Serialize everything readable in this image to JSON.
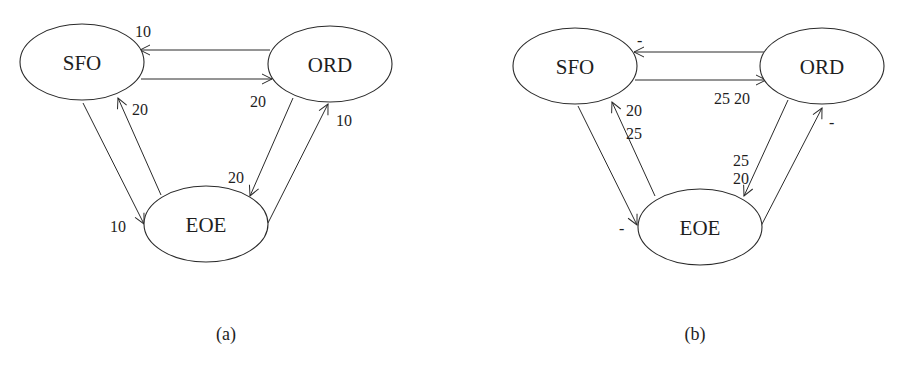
{
  "diagrams": [
    {
      "id": "a",
      "caption": "(a)",
      "nodes": [
        {
          "id": "SFO",
          "label": "SFO",
          "cx": 82,
          "cy": 62,
          "rx": 62,
          "ry": 38
        },
        {
          "id": "ORD",
          "label": "ORD",
          "cx": 330,
          "cy": 64,
          "rx": 62,
          "ry": 38
        },
        {
          "id": "EOE",
          "label": "EOE",
          "cx": 206,
          "cy": 224,
          "rx": 62,
          "ry": 38
        }
      ],
      "edges": [
        {
          "from": "ORD",
          "to": "SFO",
          "x1": 270,
          "y1": 50,
          "x2": 140,
          "y2": 50,
          "label": "10",
          "lx": 135,
          "ly": 37
        },
        {
          "from": "SFO",
          "to": "ORD",
          "x1": 141,
          "y1": 79,
          "x2": 272,
          "y2": 79,
          "label": "20",
          "lx": 250,
          "ly": 107
        },
        {
          "from": "SFO",
          "to": "EOE",
          "x1": 83,
          "y1": 103,
          "x2": 144,
          "y2": 224,
          "label": "10",
          "lx": 110,
          "ly": 232
        },
        {
          "from": "EOE",
          "to": "SFO",
          "x1": 161,
          "y1": 195,
          "x2": 118,
          "y2": 98,
          "label": "20",
          "lx": 132,
          "ly": 115
        },
        {
          "from": "ORD",
          "to": "EOE",
          "x1": 293,
          "y1": 98,
          "x2": 250,
          "y2": 196,
          "label": "20",
          "lx": 228,
          "ly": 183
        },
        {
          "from": "EOE",
          "to": "ORD",
          "x1": 268,
          "y1": 223,
          "x2": 328,
          "y2": 104,
          "label": "10",
          "lx": 336,
          "ly": 126
        }
      ]
    },
    {
      "id": "b",
      "caption": "(b)",
      "nodes": [
        {
          "id": "SFO",
          "label": "SFO",
          "cx": 575,
          "cy": 66,
          "rx": 62,
          "ry": 38
        },
        {
          "id": "ORD",
          "label": "ORD",
          "cx": 822,
          "cy": 66,
          "rx": 62,
          "ry": 38
        },
        {
          "id": "EOE",
          "label": "EOE",
          "cx": 700,
          "cy": 227,
          "rx": 62,
          "ry": 38
        }
      ],
      "edges": [
        {
          "from": "ORD",
          "to": "SFO",
          "x1": 764,
          "y1": 52,
          "x2": 634,
          "y2": 52,
          "label": "-",
          "lx": 637,
          "ly": 46
        },
        {
          "from": "SFO",
          "to": "ORD",
          "x1": 635,
          "y1": 80,
          "x2": 766,
          "y2": 80,
          "label": "25 20",
          "lx": 714,
          "ly": 104
        },
        {
          "from": "SFO",
          "to": "EOE",
          "x1": 578,
          "y1": 106,
          "x2": 637,
          "y2": 225,
          "label": "-",
          "lx": 619,
          "ly": 234
        },
        {
          "from": "EOE",
          "to": "SFO",
          "x1": 655,
          "y1": 196,
          "x2": 612,
          "y2": 102,
          "label": "20\n25",
          "lx": 626,
          "ly": 116
        },
        {
          "from": "ORD",
          "to": "EOE",
          "x1": 788,
          "y1": 100,
          "x2": 744,
          "y2": 196,
          "label": "25\n20",
          "lx": 733,
          "ly": 166
        },
        {
          "from": "EOE",
          "to": "ORD",
          "x1": 761,
          "y1": 226,
          "x2": 822,
          "y2": 108,
          "label": "-",
          "lx": 829,
          "ly": 128
        }
      ]
    }
  ]
}
